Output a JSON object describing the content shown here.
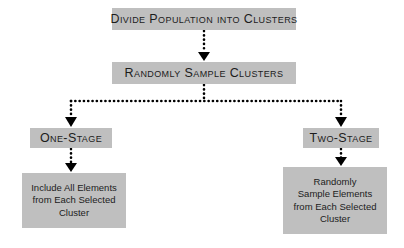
{
  "diagram": {
    "colors": {
      "background": "#ffffff",
      "node_fill": "#bfbfbf",
      "text": "#1c1c1c",
      "connector": "#000000"
    },
    "nodes": {
      "divide": {
        "label": "Divide Population into Clusters",
        "style": "small-caps"
      },
      "randomly_sample": {
        "label": "Randomly Sample Clusters",
        "style": "small-caps"
      },
      "one_stage": {
        "label": "One-Stage",
        "style": "small-caps"
      },
      "two_stage": {
        "label": "Two-Stage",
        "style": "small-caps"
      },
      "one_stage_detail": {
        "line1": "Include All Elements",
        "line2": "from Each Selected",
        "line3": "Cluster"
      },
      "two_stage_detail": {
        "line1": "Randomly",
        "line2": "Sample Elements",
        "line3": "from Each Selected",
        "line4": "Cluster"
      }
    },
    "connectors": {
      "style": "dotted",
      "arrowhead": "solid-triangle-down",
      "edges": [
        "divide-to-randomly-sample",
        "randomly-sample-to-branch-bus",
        "branch-bus-to-one-stage",
        "branch-bus-to-two-stage",
        "one-stage-to-detail",
        "two-stage-to-detail"
      ]
    }
  }
}
